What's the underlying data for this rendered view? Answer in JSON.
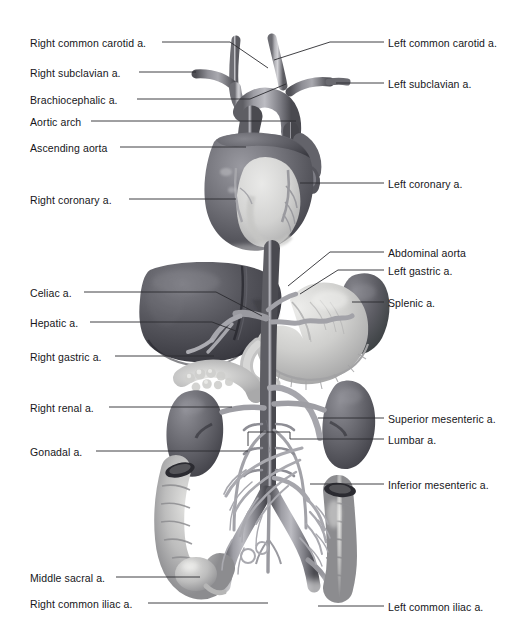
{
  "figure": {
    "background_color": "#ffffff",
    "label_color": "#16161a",
    "leader_color": "#2b2b30",
    "width": 520,
    "height": 643
  },
  "labels_left": [
    {
      "id": "right-common-carotid",
      "text": "Right common carotid a.",
      "x": 30,
      "y": 37,
      "anchor_x": 162,
      "anchor_y": 42
    },
    {
      "id": "right-subclavian",
      "text": "Right subclavian a.",
      "x": 30,
      "y": 67,
      "anchor_x": 139,
      "anchor_y": 72
    },
    {
      "id": "brachiocephalic",
      "text": "Brachiocephalic a.",
      "x": 30,
      "y": 94,
      "anchor_x": 137,
      "anchor_y": 99
    },
    {
      "id": "aortic-arch",
      "text": "Aortic arch",
      "x": 30,
      "y": 116,
      "anchor_x": 91,
      "anchor_y": 121
    },
    {
      "id": "ascending-aorta",
      "text": "Ascending aorta",
      "x": 30,
      "y": 142,
      "anchor_x": 120,
      "anchor_y": 147
    },
    {
      "id": "right-coronary",
      "text": "Right coronary a.",
      "x": 30,
      "y": 194,
      "anchor_x": 129,
      "anchor_y": 199
    },
    {
      "id": "celiac",
      "text": "Celiac a.",
      "x": 30,
      "y": 287,
      "anchor_x": 84,
      "anchor_y": 292
    },
    {
      "id": "hepatic",
      "text": "Hepatic a.",
      "x": 30,
      "y": 317,
      "anchor_x": 90,
      "anchor_y": 322
    },
    {
      "id": "right-gastric",
      "text": "Right gastric a.",
      "x": 30,
      "y": 351,
      "anchor_x": 115,
      "anchor_y": 356
    },
    {
      "id": "right-renal",
      "text": "Right renal a.",
      "x": 30,
      "y": 402,
      "anchor_x": 109,
      "anchor_y": 407
    },
    {
      "id": "gonadal",
      "text": "Gonadal a.",
      "x": 30,
      "y": 446,
      "anchor_x": 96,
      "anchor_y": 451
    },
    {
      "id": "middle-sacral",
      "text": "Middle sacral a.",
      "x": 30,
      "y": 572,
      "anchor_x": 116,
      "anchor_y": 577
    },
    {
      "id": "right-common-iliac",
      "text": "Right common iliac a.",
      "x": 30,
      "y": 598,
      "anchor_x": 148,
      "anchor_y": 603
    }
  ],
  "labels_right": [
    {
      "id": "left-common-carotid",
      "text": "Left common carotid a.",
      "x": 388,
      "y": 37,
      "anchor_x": 384,
      "anchor_y": 42
    },
    {
      "id": "left-subclavian",
      "text": "Left subclavian a.",
      "x": 388,
      "y": 78,
      "anchor_x": 384,
      "anchor_y": 83
    },
    {
      "id": "left-coronary",
      "text": "Left coronary a.",
      "x": 388,
      "y": 178,
      "anchor_x": 384,
      "anchor_y": 183
    },
    {
      "id": "abdominal-aorta",
      "text": "Abdominal aorta",
      "x": 388,
      "y": 247,
      "anchor_x": 384,
      "anchor_y": 252
    },
    {
      "id": "left-gastric",
      "text": "Left gastric a.",
      "x": 388,
      "y": 265,
      "anchor_x": 384,
      "anchor_y": 270
    },
    {
      "id": "splenic",
      "text": "Splenic a.",
      "x": 388,
      "y": 297,
      "anchor_x": 384,
      "anchor_y": 302
    },
    {
      "id": "superior-mesenteric",
      "text": "Superior mesenteric a.",
      "x": 388,
      "y": 413,
      "anchor_x": 384,
      "anchor_y": 418
    },
    {
      "id": "lumbar",
      "text": "Lumbar a.",
      "x": 388,
      "y": 434,
      "anchor_x": 384,
      "anchor_y": 439
    },
    {
      "id": "inferior-mesenteric",
      "text": "Inferior mesenteric a.",
      "x": 388,
      "y": 479,
      "anchor_x": 384,
      "anchor_y": 484
    },
    {
      "id": "left-common-iliac",
      "text": "Left common iliac a.",
      "x": 388,
      "y": 601,
      "anchor_x": 384,
      "anchor_y": 606
    }
  ],
  "structures": [
    {
      "id": "heart",
      "name": "heart"
    },
    {
      "id": "aortic-arch-vessel",
      "name": "aortic arch"
    },
    {
      "id": "liver",
      "name": "liver"
    },
    {
      "id": "stomach",
      "name": "stomach"
    },
    {
      "id": "spleen",
      "name": "spleen"
    },
    {
      "id": "pancreas",
      "name": "pancreas"
    },
    {
      "id": "right-kidney",
      "name": "right kidney"
    },
    {
      "id": "left-kidney",
      "name": "left kidney"
    },
    {
      "id": "ascending-colon",
      "name": "ascending colon"
    },
    {
      "id": "descending-colon",
      "name": "descending colon"
    },
    {
      "id": "abdominal-aorta-vessel",
      "name": "abdominal aorta"
    },
    {
      "id": "iliac-bifurcation",
      "name": "common iliac bifurcation"
    }
  ]
}
